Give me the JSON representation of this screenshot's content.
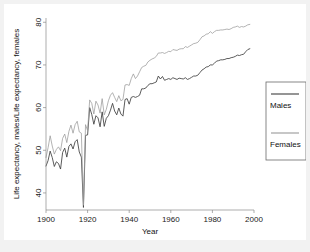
{
  "figure": {
    "background_color": "#f2f2f2",
    "plot_background_color": "#ffffff"
  },
  "chart_data": {
    "type": "line",
    "title": "",
    "xlabel": "Year",
    "ylabel": "Life expectancy, males/Life expectancy, females",
    "xlim": [
      1900,
      2000
    ],
    "ylim": [
      36,
      81
    ],
    "xticks": [
      1900,
      1920,
      1940,
      1960,
      1980,
      2000
    ],
    "xtick_labels": [
      "1900",
      "1920",
      "1940",
      "1960",
      "1980",
      "2000"
    ],
    "yticks": [
      40,
      50,
      60,
      70,
      80
    ],
    "ytick_labels": [
      "40",
      "50",
      "60",
      "70",
      "80"
    ],
    "grid": "horizontal",
    "legend_position": "right-outside",
    "annotations": [
      "Sharp downward spike at 1918 for both sexes (influenza pandemic)"
    ],
    "x": [
      1900,
      1901,
      1902,
      1903,
      1904,
      1905,
      1906,
      1907,
      1908,
      1909,
      1910,
      1911,
      1912,
      1913,
      1914,
      1915,
      1916,
      1917,
      1918,
      1919,
      1920,
      1921,
      1922,
      1923,
      1924,
      1925,
      1926,
      1927,
      1928,
      1929,
      1930,
      1931,
      1932,
      1933,
      1934,
      1935,
      1936,
      1937,
      1938,
      1939,
      1940,
      1941,
      1942,
      1943,
      1944,
      1945,
      1946,
      1947,
      1948,
      1949,
      1950,
      1951,
      1952,
      1953,
      1954,
      1955,
      1956,
      1957,
      1958,
      1959,
      1960,
      1961,
      1962,
      1963,
      1964,
      1965,
      1966,
      1967,
      1968,
      1969,
      1970,
      1971,
      1972,
      1973,
      1974,
      1975,
      1976,
      1977,
      1978,
      1979,
      1980,
      1981,
      1982,
      1983,
      1984,
      1985,
      1986,
      1987,
      1988,
      1989,
      1990,
      1991,
      1992,
      1993,
      1994,
      1995,
      1996,
      1997,
      1998
    ],
    "series": [
      {
        "name": "Males",
        "color": "#3f3f3f",
        "values": [
          46.3,
          47.6,
          49.8,
          48.3,
          46.2,
          47.3,
          46.9,
          45.6,
          49.5,
          50.5,
          48.4,
          50.9,
          51.5,
          50.3,
          52.0,
          52.5,
          49.6,
          48.4,
          36.6,
          53.5,
          53.6,
          60.0,
          58.4,
          56.1,
          58.1,
          57.6,
          55.5,
          59.0,
          55.6,
          57.5,
          58.1,
          59.4,
          61.0,
          59.2,
          58.3,
          59.9,
          58.5,
          58.0,
          61.9,
          62.1,
          60.8,
          62.4,
          62.6,
          62.4,
          62.6,
          62.9,
          64.4,
          64.4,
          64.6,
          65.2,
          65.6,
          65.6,
          65.8,
          66.0,
          67.4,
          66.7,
          67.3,
          66.4,
          66.6,
          66.8,
          66.6,
          67.0,
          66.8,
          66.6,
          66.9,
          66.8,
          66.7,
          67.0,
          66.6,
          66.8,
          67.1,
          67.4,
          67.4,
          67.6,
          68.2,
          68.8,
          69.1,
          69.5,
          69.6,
          70.0,
          70.0,
          70.4,
          70.9,
          71.0,
          71.2,
          71.2,
          71.3,
          71.5,
          71.5,
          71.7,
          71.8,
          72.0,
          72.3,
          72.2,
          72.4,
          72.5,
          73.1,
          73.6,
          73.8
        ]
      },
      {
        "name": "Females",
        "color": "#9a9a9a",
        "values": [
          48.3,
          50.6,
          53.4,
          51.0,
          49.1,
          50.2,
          50.8,
          49.9,
          52.8,
          53.8,
          51.8,
          54.4,
          55.9,
          54.0,
          56.0,
          56.8,
          54.3,
          54.0,
          37.1,
          56.0,
          54.6,
          61.8,
          61.0,
          58.5,
          61.5,
          60.6,
          58.7,
          62.1,
          58.3,
          59.6,
          61.6,
          62.9,
          63.5,
          62.4,
          61.4,
          62.8,
          61.6,
          61.9,
          65.3,
          65.4,
          65.2,
          66.8,
          67.9,
          66.8,
          67.4,
          68.4,
          69.4,
          69.7,
          69.9,
          70.7,
          71.1,
          71.4,
          71.6,
          72.0,
          72.8,
          72.8,
          72.9,
          72.7,
          72.9,
          73.2,
          73.1,
          73.6,
          73.5,
          73.4,
          73.7,
          73.8,
          73.8,
          74.3,
          74.1,
          74.4,
          74.7,
          75.0,
          75.1,
          75.3,
          75.9,
          76.6,
          76.8,
          77.2,
          77.3,
          77.8,
          77.4,
          77.8,
          78.1,
          78.1,
          78.2,
          78.2,
          78.3,
          78.4,
          78.3,
          78.5,
          78.8,
          78.9,
          79.1,
          78.8,
          79.0,
          78.9,
          79.1,
          79.4,
          79.5
        ]
      }
    ]
  },
  "legend": {
    "items": [
      {
        "label": "Males",
        "color": "#3f3f3f"
      },
      {
        "label": "Females",
        "color": "#9a9a9a"
      }
    ]
  }
}
